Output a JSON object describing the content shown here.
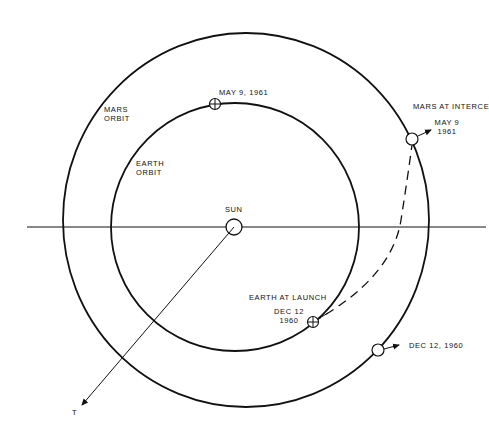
{
  "diagram": {
    "colors": {
      "line": "#111111",
      "background": "#ffffff"
    },
    "bodies": {
      "sun": {
        "label": "SUN"
      },
      "t_axis": {
        "label": "T"
      }
    },
    "orbits": {
      "mars": {
        "label_line1": "MARS",
        "label_line2": "ORBIT"
      },
      "earth": {
        "label_line1": "EARTH",
        "label_line2": "ORBIT"
      }
    },
    "markers": {
      "earth_may": {
        "label": "MAY 9, 1961"
      },
      "mars_intercept": {
        "title": "MARS AT INTERCE",
        "date_line1": "MAY 9",
        "date_line2": "1961"
      },
      "earth_launch": {
        "title": "EARTH AT LAUNCH",
        "date_line1": "DEC 12",
        "date_line2": "1960"
      },
      "mars_dec": {
        "label": "DEC 12, 1960"
      }
    }
  }
}
